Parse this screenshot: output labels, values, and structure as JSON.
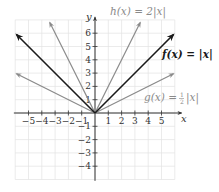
{
  "chart_data": {
    "type": "line",
    "title": "",
    "xlabel": "x",
    "ylabel": "y",
    "xlim": [
      -6,
      6.5
    ],
    "ylim": [
      -5,
      7
    ],
    "grid": true,
    "x_ticks": [
      "-5",
      "-4",
      "-3",
      "-2",
      "-1",
      "1",
      "2",
      "3",
      "4",
      "5"
    ],
    "y_ticks": [
      "6",
      "5",
      "4",
      "3",
      "2",
      "1",
      "-1",
      "-2",
      "-3",
      "-4"
    ],
    "series": [
      {
        "name": "f(x) = |x|",
        "label_main": "f(x) = |x|",
        "color": "#1a1a1a",
        "x": [
          -5.9,
          0,
          5.9
        ],
        "y": [
          5.9,
          0,
          5.9
        ]
      },
      {
        "name": "h(x) = 2|x|",
        "label_main": "h(x) = 2|x|",
        "color": "#8a8a8a",
        "x": [
          -3.4,
          0,
          3.4
        ],
        "y": [
          6.8,
          0,
          6.8
        ]
      },
      {
        "name": "g(x) = 1/2|x|",
        "label_main": "g(x) = ",
        "label_frac_num": "1",
        "label_frac_den": "2",
        "label_tail": "|x|",
        "color": "#8a8a8a",
        "x": [
          -5.9,
          0,
          5.9
        ],
        "y": [
          2.95,
          0,
          2.95
        ]
      }
    ]
  }
}
